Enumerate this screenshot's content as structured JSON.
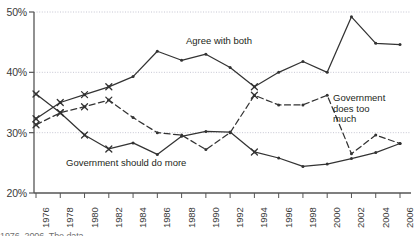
{
  "chart_data": {
    "type": "line",
    "title": "",
    "subtitle": "",
    "xlabel": "",
    "ylabel": "",
    "x": [
      1976,
      1978,
      1980,
      1982,
      1984,
      1986,
      1988,
      1990,
      1992,
      1994,
      1996,
      1998,
      2000,
      2002,
      2004,
      2006
    ],
    "xlim": [
      1976,
      2006
    ],
    "ylim": [
      20,
      50
    ],
    "ytick_values": [
      20,
      30,
      40,
      50
    ],
    "ytick_labels": [
      "20%",
      "30%",
      "40%",
      "50%"
    ],
    "xtick_labels": [
      "1976",
      "1978",
      "1980",
      "1982",
      "1984",
      "1986",
      "1988",
      "1990",
      "1992",
      "1994",
      "1996",
      "1998",
      "2000",
      "2002",
      "2004",
      "2006"
    ],
    "grid": "horizontal-dotted",
    "legend_position": "inline-annotations",
    "series": [
      {
        "name": "Agree with both",
        "style": "solid",
        "marker": "diamond-with-x-early",
        "color": "#333333",
        "label_text": "Agree with both",
        "values": [
          32.3,
          35.0,
          36.3,
          37.6,
          39.3,
          43.5,
          42.0,
          43.0,
          40.8,
          37.6,
          40.0,
          41.8,
          40.0,
          49.2,
          44.8,
          44.6
        ]
      },
      {
        "name": "Government does too much",
        "style": "dashed",
        "marker": "x-early",
        "color": "#333333",
        "label_text": "Government does too much",
        "values": [
          31.3,
          33.3,
          34.3,
          35.4,
          32.5,
          30.0,
          29.6,
          27.2,
          30.0,
          36.2,
          34.6,
          34.6,
          36.2,
          26.5,
          29.6,
          28.2
        ]
      },
      {
        "name": "Government should do more",
        "style": "solid",
        "marker": "x-early",
        "color": "#333333",
        "label_text": "Government should do more",
        "values": [
          36.4,
          33.3,
          29.6,
          27.3,
          28.3,
          26.4,
          29.4,
          30.2,
          30.1,
          26.8,
          25.8,
          24.4,
          24.8,
          25.7,
          26.7,
          28.2
        ]
      }
    ],
    "annotations": [
      {
        "text": "Agree with both",
        "x_px": 186,
        "y_px": 36
      },
      {
        "text": "Government does too much",
        "x_px": 333,
        "y_px": 93
      },
      {
        "text": "Government should do more",
        "x_px": 66,
        "y_px": 158
      }
    ],
    "colors": {
      "line": "#333333",
      "axis": "#555555",
      "grid": "#b8b8c8",
      "text": "#231f20",
      "tick_text": "#3a3a3a",
      "background": "#ffffff"
    }
  },
  "caption": {
    "partial_text": "1976–2006. The data"
  }
}
